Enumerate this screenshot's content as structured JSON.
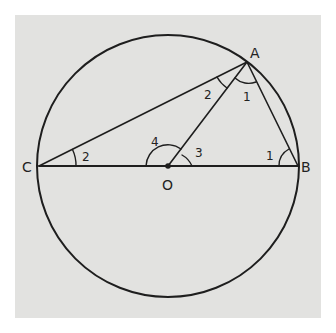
{
  "figure": {
    "background_color": "#e2e2e0",
    "stroke_color": "#1e1e1e",
    "circle": {
      "cx": 168,
      "cy": 166,
      "r": 131
    },
    "points": {
      "A": {
        "label": "A",
        "x": 247,
        "y": 62
      },
      "B": {
        "label": "B",
        "x": 298,
        "y": 166
      },
      "C": {
        "label": "C",
        "x": 39,
        "y": 166
      },
      "O": {
        "label": "O",
        "x": 168,
        "y": 166
      }
    },
    "segments": [
      "CB",
      "CA",
      "AB",
      "OA"
    ],
    "angle_labels": {
      "C_angle": "2",
      "A_left": "2",
      "A_right": "1",
      "B_angle": "1",
      "O_left": "4",
      "O_right": "3"
    }
  }
}
